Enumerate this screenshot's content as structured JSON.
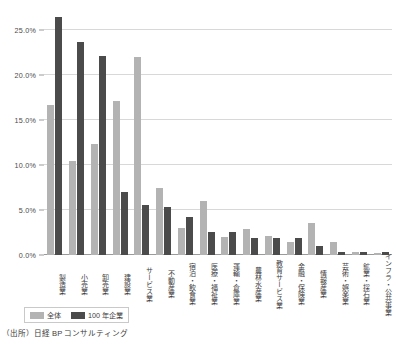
{
  "chart_data": {
    "type": "bar",
    "title": "",
    "xlabel": "",
    "ylabel": "",
    "ylim": [
      0,
      27.5
    ],
    "grid": true,
    "legend_position": "bottom-left",
    "ytick_labels": [
      "25.0%",
      "20.0%",
      "15.0%",
      "10.0%",
      "5.0%",
      "0.0%"
    ],
    "ytick_values": [
      25.0,
      20.0,
      15.0,
      10.0,
      5.0,
      0.0
    ],
    "categories": [
      "製造業",
      "小売業",
      "卸売業",
      "建設業",
      "サービス業",
      "不動産業",
      "宿泊・飲食業",
      "医療・福祉業",
      "運輸・倉庫業",
      "農林水産業",
      "教育サービス業",
      "金融・保険業",
      "情報産業",
      "芸術・娯楽業",
      "鉱業・採石業",
      "インフラ・公共事業"
    ],
    "series": [
      {
        "name": "全体",
        "color": "#b3b3b3",
        "values": [
          16.7,
          10.5,
          12.4,
          17.2,
          22.0,
          7.5,
          3.0,
          6.0,
          2.0,
          2.9,
          2.1,
          1.5,
          3.6,
          1.4,
          0.3,
          0.2
        ]
      },
      {
        "name": "100年企業",
        "color": "#4b4b4b",
        "values": [
          26.5,
          23.7,
          22.2,
          7.0,
          5.6,
          5.3,
          4.2,
          2.6,
          2.6,
          1.9,
          1.9,
          1.9,
          1.0,
          0.3,
          0.3,
          0.3
        ]
      }
    ]
  },
  "legend": {
    "items": [
      {
        "label": "全体"
      },
      {
        "label": "100 年企業"
      }
    ]
  },
  "source": {
    "text": "（出所）日経 BP コンサルティング"
  }
}
